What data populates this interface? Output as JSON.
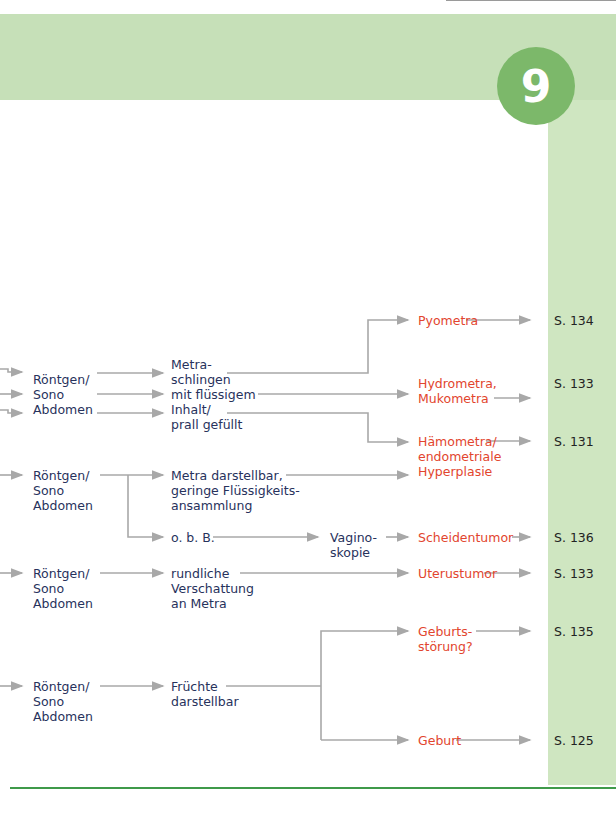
{
  "chapter": {
    "number": "9"
  },
  "colors": {
    "band": "#c6e0b8",
    "side": "#cfe6c1",
    "badge": "#7cb86a",
    "diagnosis": "#e2452e",
    "text": "#27325c",
    "arrow": "#a8a8a8",
    "rule": "#3f9a4a"
  },
  "rows": [
    {
      "exam": "Röntgen/\nSono\nAbdomen",
      "finding": "Metra-\nschlingen\nmit flüssigem\nInhalt/\nprall gefüllt",
      "results": [
        {
          "diagnosis": "Pyometra",
          "page": "S. 134"
        },
        {
          "diagnosis": "Hydrometra,\nMukometra",
          "page": "S. 133"
        },
        {
          "diagnosis": "Hämometra/\nendometriale\nHyperplasie",
          "page": "S. 131"
        }
      ]
    },
    {
      "exam": "Röntgen/\nSono\nAbdomen",
      "finding": "Metra darstellbar,\ngeringe Flüssigkeits-\nansammlung",
      "finding2": "o. b. B.",
      "followup": "Vagino-\nskopie",
      "results": [
        {
          "diagnosis": "Scheidentumor",
          "page": "S. 136"
        }
      ]
    },
    {
      "exam": "Röntgen/\nSono\nAbdomen",
      "finding": "rundliche\nVerschattung\nan Metra",
      "results": [
        {
          "diagnosis": "Uterustumor",
          "page": "S. 133"
        }
      ]
    },
    {
      "exam": "Röntgen/\nSono\nAbdomen",
      "finding": "Früchte\ndarstellbar",
      "results": [
        {
          "diagnosis": "Geburts-\nstörung?",
          "page": "S. 135"
        },
        {
          "diagnosis": "Geburt",
          "page": "S. 125"
        }
      ]
    }
  ]
}
